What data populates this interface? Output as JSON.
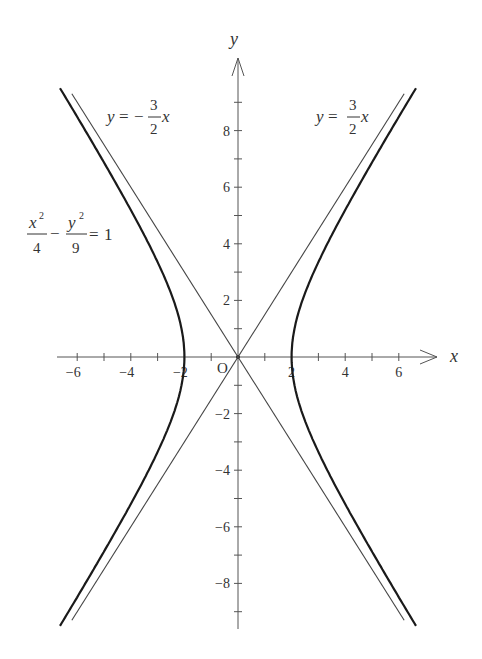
{
  "chart_data": {
    "type": "line",
    "title": "",
    "xlabel": "x",
    "ylabel": "y",
    "origin_label": "O",
    "xlim": [
      -6.5,
      7.5
    ],
    "ylim": [
      -9.7,
      10.5
    ],
    "grid": false,
    "x_ticks": [
      -6,
      -5,
      -4,
      -3,
      -2,
      -1,
      1,
      2,
      3,
      4,
      5,
      6
    ],
    "x_tick_labels": [
      {
        "value": -6,
        "label": "−6"
      },
      {
        "value": -4,
        "label": "−4"
      },
      {
        "value": -2,
        "label": "−2"
      },
      {
        "value": 2,
        "label": "2"
      },
      {
        "value": 4,
        "label": "4"
      },
      {
        "value": 6,
        "label": "6"
      }
    ],
    "y_ticks": [
      -9,
      -8,
      -7,
      -6,
      -5,
      -4,
      -3,
      -2,
      -1,
      1,
      2,
      3,
      4,
      5,
      6,
      7,
      8,
      9
    ],
    "y_tick_labels": [
      {
        "value": 8,
        "label": "8"
      },
      {
        "value": 6,
        "label": "6"
      },
      {
        "value": 4,
        "label": "4"
      },
      {
        "value": 2,
        "label": "2"
      },
      {
        "value": -2,
        "label": "−2"
      },
      {
        "value": -4,
        "label": "−4"
      },
      {
        "value": -6,
        "label": "−6"
      },
      {
        "value": -8,
        "label": "−8"
      }
    ],
    "series": [
      {
        "name": "hyperbola",
        "equation": "x^2/4 - y^2/9 = 1",
        "a": 2,
        "b": 3,
        "y_range": [
          -9.5,
          9.5
        ],
        "style": "thick",
        "color": "#1a1a1a"
      },
      {
        "name": "asymptote_positive",
        "equation": "y = 3/2 x",
        "slope": 1.5,
        "x_range": [
          -6.2,
          6.2
        ],
        "style": "thin",
        "color": "#444444"
      },
      {
        "name": "asymptote_negative",
        "equation": "y = -3/2 x",
        "slope": -1.5,
        "x_range": [
          -6.2,
          6.2
        ],
        "style": "thin",
        "color": "#444444"
      }
    ],
    "annotations": [
      {
        "id": "asym_neg_label",
        "text": "y = −3/2 x",
        "lhs": "y",
        "eq": "=",
        "sign": "−",
        "num": "3",
        "den": "2",
        "var": "x"
      },
      {
        "id": "asym_pos_label",
        "text": "y = 3/2 x",
        "lhs": "y",
        "eq": "=",
        "sign": "",
        "num": "3",
        "den": "2",
        "var": "x"
      },
      {
        "id": "hyperbola_label",
        "text": "x²/4 − y²/9 = 1",
        "x_num": "x",
        "y_num": "y",
        "sup": "2",
        "x_den": "4",
        "y_den": "9",
        "minus": "−",
        "eq": "=",
        "rhs": "1"
      }
    ]
  }
}
